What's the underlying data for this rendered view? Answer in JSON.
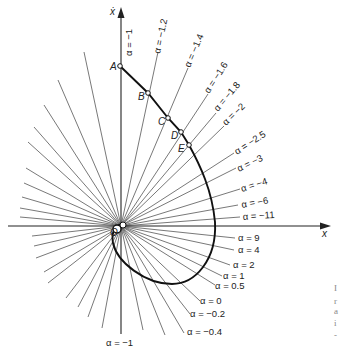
{
  "figure": {
    "axes": {
      "x_label": "x",
      "y_label": "ẋ",
      "origin_label": "O"
    },
    "points": [
      {
        "name": "A",
        "x": 120,
        "y": 66
      },
      {
        "name": "B",
        "x": 148,
        "y": 93
      },
      {
        "name": "C",
        "x": 168,
        "y": 118
      },
      {
        "name": "D",
        "x": 181,
        "y": 132
      },
      {
        "name": "E",
        "x": 189,
        "y": 145
      }
    ],
    "isoclines_upper": [
      {
        "label": "α = −1",
        "value": -1
      },
      {
        "label": "α = −1.2",
        "value": -1.2
      },
      {
        "label": "α = −1.4",
        "value": -1.4
      },
      {
        "label": "α = −1.6",
        "value": -1.6
      },
      {
        "label": "α = −1.8",
        "value": -1.8
      },
      {
        "label": "α = −2",
        "value": -2
      },
      {
        "label": "α = −2.5",
        "value": -2.5
      },
      {
        "label": "α = −3",
        "value": -3
      },
      {
        "label": "α = −4",
        "value": -4
      },
      {
        "label": "α = −6",
        "value": -6
      },
      {
        "label": "α = −11",
        "value": -11
      }
    ],
    "isoclines_lower": [
      {
        "label": "α = 9",
        "value": 9
      },
      {
        "label": "α = 4",
        "value": 4
      },
      {
        "label": "α = 2",
        "value": 2
      },
      {
        "label": "α = 1",
        "value": 1
      },
      {
        "label": "α = 0.5",
        "value": 0.5
      },
      {
        "label": "α = 0",
        "value": 0
      },
      {
        "label": "α = −0.2",
        "value": -0.2
      },
      {
        "label": "α = −0.4",
        "value": -0.4
      },
      {
        "label": "α = −1",
        "value": -1
      }
    ],
    "side_fragments": [
      "I",
      "r",
      "a",
      "i",
      "-"
    ]
  }
}
